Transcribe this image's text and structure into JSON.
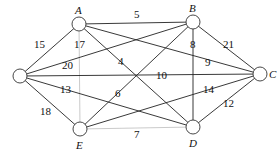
{
  "diagram": {
    "type": "weighted-undirected-graph",
    "nodes": [
      {
        "id": "O",
        "label": "",
        "x": 20,
        "y": 76
      },
      {
        "id": "A",
        "label": "A",
        "x": 79,
        "y": 24
      },
      {
        "id": "B",
        "label": "B",
        "x": 193,
        "y": 22
      },
      {
        "id": "C",
        "label": "C",
        "x": 260,
        "y": 74
      },
      {
        "id": "D",
        "label": "D",
        "x": 193,
        "y": 127
      },
      {
        "id": "E",
        "label": "E",
        "x": 80,
        "y": 129
      }
    ],
    "edges": [
      {
        "from": "O",
        "to": "A",
        "weight": "15"
      },
      {
        "from": "O",
        "to": "B",
        "weight": "20"
      },
      {
        "from": "O",
        "to": "C",
        "weight": "10"
      },
      {
        "from": "O",
        "to": "D",
        "weight": "13"
      },
      {
        "from": "O",
        "to": "E",
        "weight": "18"
      },
      {
        "from": "A",
        "to": "B",
        "weight": "5"
      },
      {
        "from": "A",
        "to": "C",
        "weight": "9"
      },
      {
        "from": "A",
        "to": "D",
        "weight": "4"
      },
      {
        "from": "A",
        "to": "E",
        "weight": "17",
        "style": "light"
      },
      {
        "from": "B",
        "to": "C",
        "weight": "21"
      },
      {
        "from": "B",
        "to": "D",
        "weight": "8"
      },
      {
        "from": "B",
        "to": "E",
        "weight": "6"
      },
      {
        "from": "C",
        "to": "D",
        "weight": "12"
      },
      {
        "from": "C",
        "to": "E",
        "weight": "14"
      },
      {
        "from": "E",
        "to": "D",
        "weight": "7",
        "style": "light"
      }
    ],
    "labels": {
      "node_A": "A",
      "node_B": "B",
      "node_C": "C",
      "node_D": "D",
      "node_E": "E",
      "w_OA": "15",
      "w_OB": "20",
      "w_OC": "10",
      "w_OD": "13",
      "w_OE": "18",
      "w_AB": "5",
      "w_AC": "9",
      "w_AD": "4",
      "w_AE": "17",
      "w_BC": "21",
      "w_BD": "8",
      "w_BE": "6",
      "w_CD": "12",
      "w_CE": "14",
      "w_ED": "7"
    }
  }
}
